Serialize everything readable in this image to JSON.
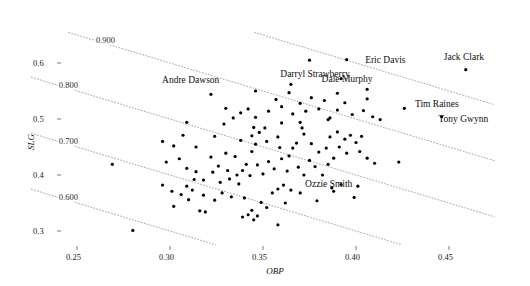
{
  "chart_data": {
    "type": "scatter",
    "title": "",
    "xlabel": "OBP",
    "ylabel": "SLG",
    "xlim": [
      0.225,
      0.475
    ],
    "ylim": [
      0.275,
      0.655
    ],
    "grid": false,
    "legend": null,
    "xticks": [
      0.25,
      0.3,
      0.35,
      0.4,
      0.45
    ],
    "xticklabels": [
      "0.25",
      "0.30",
      "0.35",
      "0.40",
      "0.45"
    ],
    "yticks": [
      0.3,
      0.4,
      0.5,
      0.6
    ],
    "yticklabels": [
      "0.3",
      "0.4",
      "0.5",
      "0.6"
    ],
    "reference_lines": {
      "description": "Dotted iso-OPS lines where OBP + SLG equals a constant",
      "values": [
        0.6,
        0.7,
        0.8,
        0.9,
        1.0
      ],
      "labels": [
        "0.600",
        "0.700",
        "0.800",
        "0.900",
        ""
      ]
    },
    "annotations": [
      {
        "label": "Eric Davis",
        "x": 0.399,
        "y": 0.593
      },
      {
        "label": "Darryl Strawberry",
        "x": 0.398,
        "y": 0.583
      },
      {
        "label": "Dale Murphy",
        "x": 0.417,
        "y": 0.58
      },
      {
        "label": "Jack Clark",
        "x": 0.459,
        "y": 0.597
      },
      {
        "label": "Tim Raines",
        "x": 0.429,
        "y": 0.526
      },
      {
        "label": "Tony Gwynn",
        "x": 0.447,
        "y": 0.511
      },
      {
        "label": "Andre Dawson",
        "x": 0.328,
        "y": 0.568
      },
      {
        "label": "Ozzie Smith",
        "x": 0.392,
        "y": 0.383
      }
    ],
    "points": [
      [
        0.28,
        0.301
      ],
      [
        0.302,
        0.344
      ],
      [
        0.31,
        0.356
      ],
      [
        0.316,
        0.336
      ],
      [
        0.319,
        0.334
      ],
      [
        0.296,
        0.382
      ],
      [
        0.269,
        0.419
      ],
      [
        0.305,
        0.429
      ],
      [
        0.309,
        0.412
      ],
      [
        0.298,
        0.423
      ],
      [
        0.323,
        0.405
      ],
      [
        0.318,
        0.391
      ],
      [
        0.328,
        0.368
      ],
      [
        0.333,
        0.361
      ],
      [
        0.34,
        0.359
      ],
      [
        0.344,
        0.337
      ],
      [
        0.352,
        0.342
      ],
      [
        0.349,
        0.351
      ],
      [
        0.362,
        0.35
      ],
      [
        0.37,
        0.368
      ],
      [
        0.379,
        0.354
      ],
      [
        0.392,
        0.383
      ],
      [
        0.401,
        0.38
      ],
      [
        0.387,
        0.377
      ],
      [
        0.302,
        0.452
      ],
      [
        0.314,
        0.45
      ],
      [
        0.307,
        0.471
      ],
      [
        0.324,
        0.469
      ],
      [
        0.33,
        0.439
      ],
      [
        0.335,
        0.433
      ],
      [
        0.338,
        0.462
      ],
      [
        0.344,
        0.47
      ],
      [
        0.346,
        0.455
      ],
      [
        0.351,
        0.484
      ],
      [
        0.358,
        0.468
      ],
      [
        0.359,
        0.449
      ],
      [
        0.364,
        0.434
      ],
      [
        0.368,
        0.457
      ],
      [
        0.37,
        0.494
      ],
      [
        0.372,
        0.473
      ],
      [
        0.376,
        0.456
      ],
      [
        0.38,
        0.441
      ],
      [
        0.384,
        0.448
      ],
      [
        0.388,
        0.43
      ],
      [
        0.391,
        0.45
      ],
      [
        0.395,
        0.439
      ],
      [
        0.402,
        0.442
      ],
      [
        0.406,
        0.43
      ],
      [
        0.41,
        0.421
      ],
      [
        0.423,
        0.423
      ],
      [
        0.314,
        0.406
      ],
      [
        0.322,
        0.432
      ],
      [
        0.326,
        0.416
      ],
      [
        0.331,
        0.408
      ],
      [
        0.336,
        0.4
      ],
      [
        0.341,
        0.419
      ],
      [
        0.344,
        0.442
      ],
      [
        0.347,
        0.418
      ],
      [
        0.35,
        0.402
      ],
      [
        0.353,
        0.424
      ],
      [
        0.356,
        0.411
      ],
      [
        0.36,
        0.429
      ],
      [
        0.363,
        0.407
      ],
      [
        0.366,
        0.448
      ],
      [
        0.369,
        0.414
      ],
      [
        0.372,
        0.4
      ],
      [
        0.375,
        0.426
      ],
      [
        0.378,
        0.415
      ],
      [
        0.382,
        0.4
      ],
      [
        0.385,
        0.419
      ],
      [
        0.329,
        0.491
      ],
      [
        0.334,
        0.502
      ],
      [
        0.338,
        0.511
      ],
      [
        0.342,
        0.518
      ],
      [
        0.346,
        0.503
      ],
      [
        0.353,
        0.514
      ],
      [
        0.357,
        0.535
      ],
      [
        0.36,
        0.522
      ],
      [
        0.364,
        0.547
      ],
      [
        0.366,
        0.509
      ],
      [
        0.37,
        0.528
      ],
      [
        0.373,
        0.514
      ],
      [
        0.376,
        0.538
      ],
      [
        0.38,
        0.518
      ],
      [
        0.383,
        0.533
      ],
      [
        0.386,
        0.502
      ],
      [
        0.39,
        0.516
      ],
      [
        0.394,
        0.529
      ],
      [
        0.398,
        0.508
      ],
      [
        0.404,
        0.515
      ],
      [
        0.409,
        0.504
      ],
      [
        0.413,
        0.499
      ],
      [
        0.365,
        0.562
      ],
      [
        0.375,
        0.605
      ],
      [
        0.392,
        0.572
      ],
      [
        0.406,
        0.553
      ],
      [
        0.322,
        0.544
      ],
      [
        0.33,
        0.519
      ],
      [
        0.309,
        0.494
      ],
      [
        0.296,
        0.46
      ],
      [
        0.301,
        0.371
      ],
      [
        0.306,
        0.365
      ],
      [
        0.312,
        0.373
      ],
      [
        0.318,
        0.364
      ],
      [
        0.339,
        0.325
      ],
      [
        0.342,
        0.329
      ],
      [
        0.345,
        0.32
      ],
      [
        0.347,
        0.327
      ],
      [
        0.355,
        0.368
      ],
      [
        0.358,
        0.375
      ],
      [
        0.361,
        0.382
      ],
      [
        0.365,
        0.373
      ],
      [
        0.399,
        0.36
      ],
      [
        0.337,
        0.384
      ],
      [
        0.332,
        0.393
      ],
      [
        0.327,
        0.387
      ],
      [
        0.313,
        0.392
      ],
      [
        0.309,
        0.38
      ],
      [
        0.345,
        0.485
      ],
      [
        0.348,
        0.476
      ],
      [
        0.352,
        0.46
      ],
      [
        0.386,
        0.468
      ],
      [
        0.39,
        0.477
      ],
      [
        0.394,
        0.464
      ],
      [
        0.397,
        0.471
      ],
      [
        0.4,
        0.458
      ],
      [
        0.403,
        0.469
      ],
      [
        0.36,
        0.493
      ],
      [
        0.371,
        0.484
      ],
      [
        0.385,
        0.499
      ],
      [
        0.343,
        0.399
      ],
      [
        0.339,
        0.408
      ],
      [
        0.324,
        0.355
      ],
      [
        0.358,
        0.311
      ]
    ],
    "labeled_points": [
      [
        0.395,
        0.606
      ],
      [
        0.39,
        0.546
      ],
      [
        0.406,
        0.536
      ],
      [
        0.459,
        0.588
      ],
      [
        0.426,
        0.519
      ],
      [
        0.446,
        0.504
      ],
      [
        0.346,
        0.55
      ],
      [
        0.388,
        0.371
      ]
    ],
    "marker": {
      "shape": "circle",
      "color": "#000000",
      "size": 3.2
    },
    "line_style": {
      "style": "dotted",
      "color": "#9a9a9a",
      "width": 0.9
    }
  }
}
